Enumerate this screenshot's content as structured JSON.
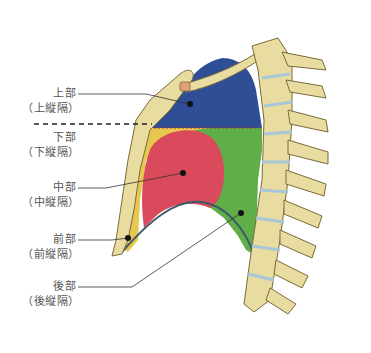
{
  "diagram": {
    "type": "anatomical-diagram",
    "colors": {
      "superior": "#2e4f96",
      "middle": "#d94a5c",
      "anterior": "#e6c84e",
      "posterior": "#5fae48",
      "bone": "#e8dca0",
      "bone_outline": "#7a6a3a",
      "disc": "#a9c6d6",
      "leader_line": "#333333"
    },
    "labels": [
      {
        "id": "superior",
        "name": "上部",
        "sub": "（上縦隔）"
      },
      {
        "id": "inferior",
        "name": "下部",
        "sub": "（下縦隔）"
      },
      {
        "id": "middle",
        "name": "中部",
        "sub": "（中縦隔）"
      },
      {
        "id": "anterior",
        "name": "前部",
        "sub": "（前縦隔）"
      },
      {
        "id": "posterior",
        "name": "後部",
        "sub": "（後縦隔）"
      }
    ]
  }
}
